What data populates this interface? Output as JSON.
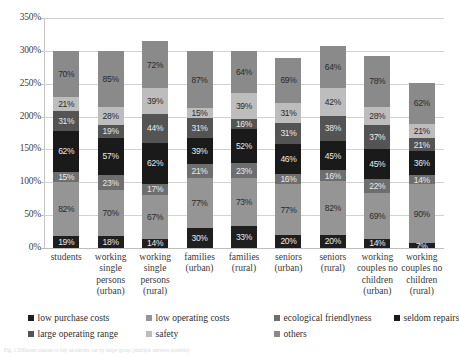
{
  "chart_data": {
    "type": "bar",
    "subtype": "stacked-bar",
    "title": "",
    "xlabel": "",
    "ylabel": "",
    "ylim": [
      0,
      350
    ],
    "ytick_labels": [
      "0%",
      "50%",
      "100%",
      "150%",
      "200%",
      "250%",
      "300%",
      "350%"
    ],
    "ytick_values": [
      0,
      50,
      100,
      150,
      200,
      250,
      300,
      350
    ],
    "grid": true,
    "legend_position": "bottom",
    "value_suffix": "%",
    "categories": [
      "students",
      "working single persons (urban)",
      "working single persons (rural)",
      "families (urban)",
      "families (rural)",
      "seniors (urban)",
      "seniors (rural)",
      "working couples no children (urban)",
      "working couples no children (rural)"
    ],
    "category_lines": [
      [
        "students"
      ],
      [
        "working",
        "single",
        "persons",
        "(urban)"
      ],
      [
        "working",
        "single",
        "persons",
        "(rural)"
      ],
      [
        "families",
        "(urban)"
      ],
      [
        "families",
        "(rural)"
      ],
      [
        "seniors",
        "(urban)"
      ],
      [
        "seniors",
        "(rural)"
      ],
      [
        "working",
        "couples no",
        "children",
        "(urban)"
      ],
      [
        "working",
        "couples no",
        "children",
        "(rural)"
      ]
    ],
    "series": [
      {
        "name": "low purchase costs",
        "color": "#1f1f1f",
        "label_on_dark": true,
        "values": [
          19,
          18,
          14,
          30,
          33,
          20,
          20,
          14,
          7
        ]
      },
      {
        "name": "low operating costs",
        "color": "#959595",
        "label_on_dark": false,
        "values": [
          82,
          70,
          67,
          77,
          73,
          77,
          82,
          69,
          90
        ]
      },
      {
        "name": "ecological friendlyness",
        "color": "#6e6e6e",
        "label_on_dark": true,
        "values": [
          15,
          23,
          17,
          21,
          23,
          16,
          16,
          22,
          14
        ]
      },
      {
        "name": "seldom repairs",
        "color": "#1a1a1a",
        "label_on_dark": true,
        "values": [
          62,
          57,
          62,
          39,
          52,
          46,
          45,
          45,
          36
        ]
      },
      {
        "name": "large operating range",
        "color": "#545454",
        "label_on_dark": true,
        "values": [
          31,
          19,
          44,
          31,
          16,
          31,
          38,
          37,
          21
        ]
      },
      {
        "name": "safety",
        "color": "#bdbdbd",
        "label_on_dark": false,
        "values": [
          21,
          28,
          39,
          15,
          39,
          31,
          42,
          28,
          21
        ]
      },
      {
        "name": "others",
        "color": "#8a8a8a",
        "label_on_dark": false,
        "values": [
          70,
          85,
          72,
          87,
          64,
          69,
          64,
          78,
          62
        ]
      }
    ]
  },
  "caption": {
    "text": "Fig. 1  Different reasons to buy an electric car by target group (multiple answers possible)"
  }
}
